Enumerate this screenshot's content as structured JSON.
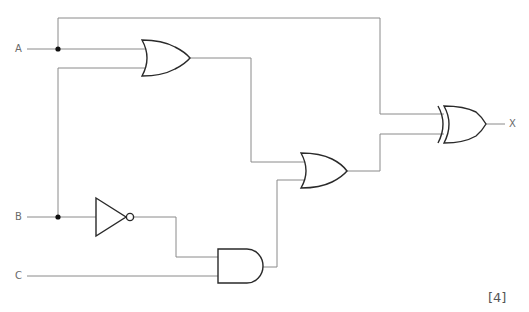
{
  "diagram": {
    "type": "logic-circuit",
    "inputs": [
      {
        "name": "A",
        "label": "A"
      },
      {
        "name": "B",
        "label": "B"
      },
      {
        "name": "C",
        "label": "C"
      }
    ],
    "output": {
      "name": "X",
      "label": "X"
    },
    "gates": [
      {
        "id": "or1",
        "type": "OR",
        "inputs": [
          "A",
          "B"
        ]
      },
      {
        "id": "not1",
        "type": "NOT",
        "inputs": [
          "B"
        ]
      },
      {
        "id": "and1",
        "type": "AND",
        "inputs": [
          "not1",
          "C"
        ]
      },
      {
        "id": "or2",
        "type": "OR",
        "inputs": [
          "or1",
          "and1"
        ]
      },
      {
        "id": "xor1",
        "type": "XOR",
        "inputs": [
          "A",
          "or2"
        ],
        "output": "X"
      }
    ],
    "marks": "[4]"
  }
}
